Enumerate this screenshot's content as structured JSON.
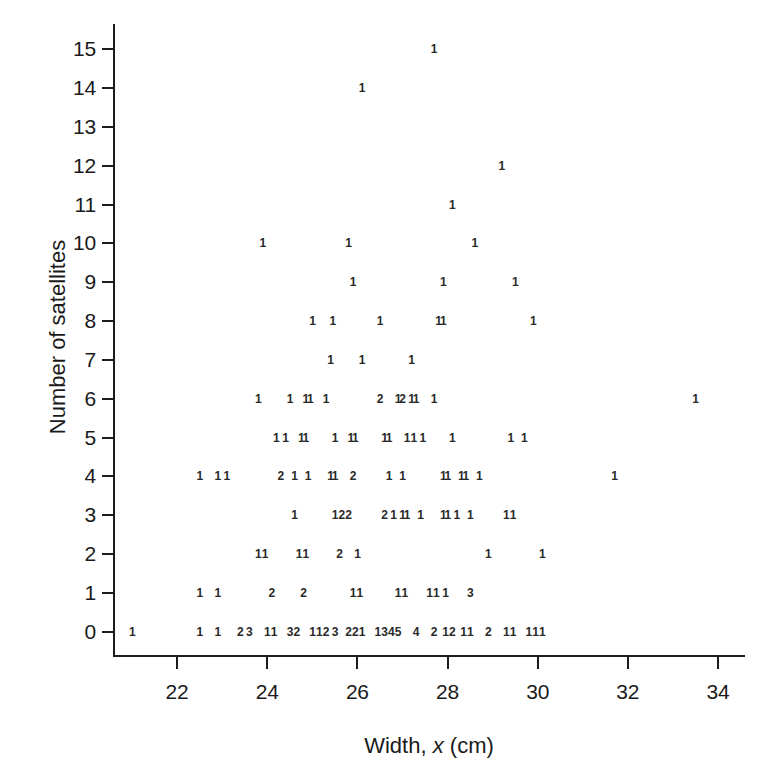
{
  "chart_data": {
    "type": "scatter",
    "title": "",
    "xlabel": "Width, x (cm)",
    "ylabel": "Number of satellites",
    "xlim": [
      20.6,
      34.6
    ],
    "ylim": [
      -0.6,
      15.6
    ],
    "xticks": [
      22,
      24,
      26,
      28,
      30,
      32,
      34
    ],
    "yticks": [
      0,
      1,
      2,
      3,
      4,
      5,
      6,
      7,
      8,
      9,
      10,
      11,
      12,
      13,
      14,
      15
    ],
    "grid": false,
    "legend": null,
    "note": "Each plotted glyph is the count of observations at that (width, satellites) location.",
    "points": [
      {
        "x": 21.0,
        "y": 0,
        "count": 1
      },
      {
        "x": 22.5,
        "y": 0,
        "count": 1
      },
      {
        "x": 22.9,
        "y": 0,
        "count": 1
      },
      {
        "x": 23.4,
        "y": 0,
        "count": 2
      },
      {
        "x": 23.6,
        "y": 0,
        "count": 3
      },
      {
        "x": 24.0,
        "y": 0,
        "count": 1
      },
      {
        "x": 24.15,
        "y": 0,
        "count": 1
      },
      {
        "x": 24.5,
        "y": 0,
        "count": 3
      },
      {
        "x": 24.65,
        "y": 0,
        "count": 2
      },
      {
        "x": 25.0,
        "y": 0,
        "count": 1
      },
      {
        "x": 25.15,
        "y": 0,
        "count": 1
      },
      {
        "x": 25.3,
        "y": 0,
        "count": 2
      },
      {
        "x": 25.5,
        "y": 0,
        "count": 3
      },
      {
        "x": 25.8,
        "y": 0,
        "count": 2
      },
      {
        "x": 25.95,
        "y": 0,
        "count": 2
      },
      {
        "x": 26.1,
        "y": 0,
        "count": 1
      },
      {
        "x": 26.45,
        "y": 0,
        "count": 1
      },
      {
        "x": 26.6,
        "y": 0,
        "count": 3
      },
      {
        "x": 26.75,
        "y": 0,
        "count": 4
      },
      {
        "x": 26.9,
        "y": 0,
        "count": 5
      },
      {
        "x": 27.3,
        "y": 0,
        "count": 4
      },
      {
        "x": 27.7,
        "y": 0,
        "count": 2
      },
      {
        "x": 27.95,
        "y": 0,
        "count": 1
      },
      {
        "x": 28.1,
        "y": 0,
        "count": 2
      },
      {
        "x": 28.35,
        "y": 0,
        "count": 1
      },
      {
        "x": 28.5,
        "y": 0,
        "count": 1
      },
      {
        "x": 28.9,
        "y": 0,
        "count": 2
      },
      {
        "x": 29.3,
        "y": 0,
        "count": 1
      },
      {
        "x": 29.45,
        "y": 0,
        "count": 1
      },
      {
        "x": 29.8,
        "y": 0,
        "count": 1
      },
      {
        "x": 29.95,
        "y": 0,
        "count": 1
      },
      {
        "x": 30.1,
        "y": 0,
        "count": 1
      },
      {
        "x": 22.5,
        "y": 1,
        "count": 1
      },
      {
        "x": 22.9,
        "y": 1,
        "count": 1
      },
      {
        "x": 24.1,
        "y": 1,
        "count": 2
      },
      {
        "x": 24.8,
        "y": 1,
        "count": 2
      },
      {
        "x": 25.9,
        "y": 1,
        "count": 1
      },
      {
        "x": 26.05,
        "y": 1,
        "count": 1
      },
      {
        "x": 26.9,
        "y": 1,
        "count": 1
      },
      {
        "x": 27.05,
        "y": 1,
        "count": 1
      },
      {
        "x": 27.6,
        "y": 1,
        "count": 1
      },
      {
        "x": 27.75,
        "y": 1,
        "count": 1
      },
      {
        "x": 27.95,
        "y": 1,
        "count": 1
      },
      {
        "x": 28.5,
        "y": 1,
        "count": 3
      },
      {
        "x": 23.8,
        "y": 2,
        "count": 1
      },
      {
        "x": 23.95,
        "y": 2,
        "count": 1
      },
      {
        "x": 24.7,
        "y": 2,
        "count": 1
      },
      {
        "x": 24.85,
        "y": 2,
        "count": 1
      },
      {
        "x": 25.6,
        "y": 2,
        "count": 2
      },
      {
        "x": 26.0,
        "y": 2,
        "count": 1
      },
      {
        "x": 28.9,
        "y": 2,
        "count": 1
      },
      {
        "x": 30.1,
        "y": 2,
        "count": 1
      },
      {
        "x": 24.6,
        "y": 3,
        "count": 1
      },
      {
        "x": 25.5,
        "y": 3,
        "count": 1
      },
      {
        "x": 25.65,
        "y": 3,
        "count": 2
      },
      {
        "x": 25.8,
        "y": 3,
        "count": 2
      },
      {
        "x": 26.6,
        "y": 3,
        "count": 2
      },
      {
        "x": 26.8,
        "y": 3,
        "count": 1
      },
      {
        "x": 27.0,
        "y": 3,
        "count": 1
      },
      {
        "x": 27.1,
        "y": 3,
        "count": 1
      },
      {
        "x": 27.4,
        "y": 3,
        "count": 1
      },
      {
        "x": 27.9,
        "y": 3,
        "count": 1
      },
      {
        "x": 28.0,
        "y": 3,
        "count": 1
      },
      {
        "x": 28.2,
        "y": 3,
        "count": 1
      },
      {
        "x": 28.5,
        "y": 3,
        "count": 1
      },
      {
        "x": 29.3,
        "y": 3,
        "count": 1
      },
      {
        "x": 29.45,
        "y": 3,
        "count": 1
      },
      {
        "x": 22.5,
        "y": 4,
        "count": 1
      },
      {
        "x": 22.9,
        "y": 4,
        "count": 1
      },
      {
        "x": 23.1,
        "y": 4,
        "count": 1
      },
      {
        "x": 24.3,
        "y": 4,
        "count": 2
      },
      {
        "x": 24.6,
        "y": 4,
        "count": 1
      },
      {
        "x": 24.9,
        "y": 4,
        "count": 1
      },
      {
        "x": 25.4,
        "y": 4,
        "count": 1
      },
      {
        "x": 25.5,
        "y": 4,
        "count": 1
      },
      {
        "x": 25.9,
        "y": 4,
        "count": 2
      },
      {
        "x": 26.7,
        "y": 4,
        "count": 1
      },
      {
        "x": 27.0,
        "y": 4,
        "count": 1
      },
      {
        "x": 27.9,
        "y": 4,
        "count": 1
      },
      {
        "x": 28.0,
        "y": 4,
        "count": 1
      },
      {
        "x": 28.3,
        "y": 4,
        "count": 1
      },
      {
        "x": 28.4,
        "y": 4,
        "count": 1
      },
      {
        "x": 28.7,
        "y": 4,
        "count": 1
      },
      {
        "x": 31.7,
        "y": 4,
        "count": 1
      },
      {
        "x": 24.2,
        "y": 5,
        "count": 1
      },
      {
        "x": 24.4,
        "y": 5,
        "count": 1
      },
      {
        "x": 24.75,
        "y": 5,
        "count": 1
      },
      {
        "x": 24.85,
        "y": 5,
        "count": 1
      },
      {
        "x": 25.5,
        "y": 5,
        "count": 1
      },
      {
        "x": 25.85,
        "y": 5,
        "count": 1
      },
      {
        "x": 25.95,
        "y": 5,
        "count": 1
      },
      {
        "x": 26.6,
        "y": 5,
        "count": 1
      },
      {
        "x": 26.7,
        "y": 5,
        "count": 1
      },
      {
        "x": 27.1,
        "y": 5,
        "count": 1
      },
      {
        "x": 27.25,
        "y": 5,
        "count": 1
      },
      {
        "x": 27.45,
        "y": 5,
        "count": 1
      },
      {
        "x": 28.1,
        "y": 5,
        "count": 1
      },
      {
        "x": 29.4,
        "y": 5,
        "count": 1
      },
      {
        "x": 29.7,
        "y": 5,
        "count": 1
      },
      {
        "x": 23.8,
        "y": 6,
        "count": 1
      },
      {
        "x": 24.5,
        "y": 6,
        "count": 1
      },
      {
        "x": 24.85,
        "y": 6,
        "count": 1
      },
      {
        "x": 24.95,
        "y": 6,
        "count": 1
      },
      {
        "x": 25.3,
        "y": 6,
        "count": 1
      },
      {
        "x": 26.5,
        "y": 6,
        "count": 2
      },
      {
        "x": 26.9,
        "y": 6,
        "count": 1
      },
      {
        "x": 27.0,
        "y": 6,
        "count": 2
      },
      {
        "x": 27.2,
        "y": 6,
        "count": 1
      },
      {
        "x": 27.3,
        "y": 6,
        "count": 1
      },
      {
        "x": 27.7,
        "y": 6,
        "count": 1
      },
      {
        "x": 33.5,
        "y": 6,
        "count": 1
      },
      {
        "x": 25.4,
        "y": 7,
        "count": 1
      },
      {
        "x": 26.1,
        "y": 7,
        "count": 1
      },
      {
        "x": 27.2,
        "y": 7,
        "count": 1
      },
      {
        "x": 25.0,
        "y": 8,
        "count": 1
      },
      {
        "x": 25.45,
        "y": 8,
        "count": 1
      },
      {
        "x": 26.5,
        "y": 8,
        "count": 1
      },
      {
        "x": 27.8,
        "y": 8,
        "count": 1
      },
      {
        "x": 27.9,
        "y": 8,
        "count": 1
      },
      {
        "x": 29.9,
        "y": 8,
        "count": 1
      },
      {
        "x": 25.9,
        "y": 9,
        "count": 1
      },
      {
        "x": 27.9,
        "y": 9,
        "count": 1
      },
      {
        "x": 29.5,
        "y": 9,
        "count": 1
      },
      {
        "x": 23.9,
        "y": 10,
        "count": 1
      },
      {
        "x": 25.8,
        "y": 10,
        "count": 1
      },
      {
        "x": 28.6,
        "y": 10,
        "count": 1
      },
      {
        "x": 28.1,
        "y": 11,
        "count": 1
      },
      {
        "x": 29.2,
        "y": 12,
        "count": 1
      },
      {
        "x": 26.1,
        "y": 14,
        "count": 1
      },
      {
        "x": 27.7,
        "y": 15,
        "count": 1
      }
    ]
  },
  "axes": {
    "x_title_prefix": "Width, ",
    "x_title_var": "x",
    "x_title_suffix": " (cm)",
    "y_title": "Number of satellites",
    "x_tick_labels": [
      "22",
      "24",
      "26",
      "28",
      "30",
      "32",
      "34"
    ],
    "y_tick_labels": [
      "0",
      "1",
      "2",
      "3",
      "4",
      "5",
      "6",
      "7",
      "8",
      "9",
      "10",
      "11",
      "12",
      "13",
      "14",
      "15"
    ]
  },
  "style": {
    "axis_color": "#1d1d1d",
    "text_color": "#1a1a1a",
    "marker_color": "#2a2a2a",
    "background": "#ffffff"
  }
}
